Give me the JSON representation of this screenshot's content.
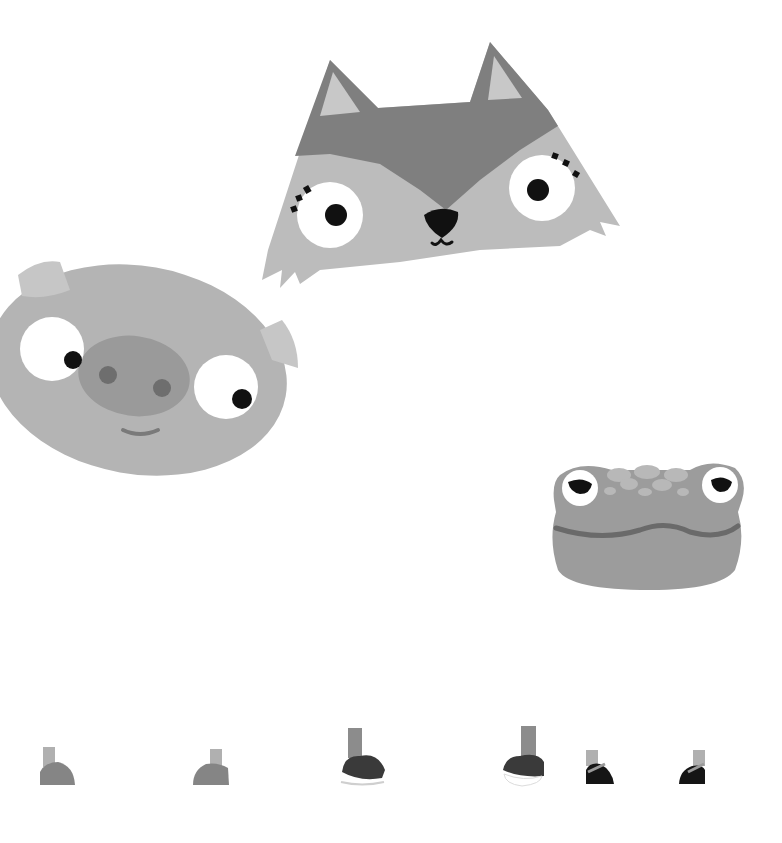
{
  "scene": {
    "title": "Animal faces and feet illustration",
    "background": "#ffffff"
  },
  "colors": {
    "fox_dark": "#7f7f7f",
    "fox_light": "#bcbcbc",
    "fox_ear_inner": "#c8c8c8",
    "pig_body": "#b4b4b4",
    "pig_ear": "#c6c6c6",
    "pig_snout": "#9a9a9a",
    "pig_nostril": "#6e6e6e",
    "frog_body": "#9c9c9c",
    "frog_spot": "#b8b8b8",
    "frog_mouth": "#6a6a6a",
    "eye_white": "#ffffff",
    "pupil": "#111111",
    "shoe_gray": "#858585",
    "leg_light": "#b0b0b0",
    "leg_mid": "#8c8c8c",
    "sneaker_dark": "#3a3a3a",
    "shoe_black": "#151515"
  },
  "characters": [
    {
      "name": "fox",
      "label": "Fox face"
    },
    {
      "name": "pig",
      "label": "Pig face"
    },
    {
      "name": "frog",
      "label": "Frog face"
    }
  ],
  "feet": [
    {
      "name": "pig-foot-left",
      "type": "hoof"
    },
    {
      "name": "pig-foot-right",
      "type": "hoof"
    },
    {
      "name": "fox-foot-left",
      "type": "sneaker"
    },
    {
      "name": "fox-foot-right",
      "type": "sneaker"
    },
    {
      "name": "frog-foot-left",
      "type": "strap-shoe"
    },
    {
      "name": "frog-foot-right",
      "type": "strap-shoe"
    }
  ]
}
